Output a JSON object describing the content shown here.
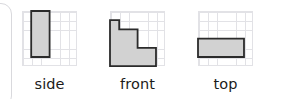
{
  "canvas": {
    "width": 285,
    "height": 99,
    "background": "#ffffff"
  },
  "style": {
    "grid_line_color": "#e2e2e6",
    "shape_fill": "#d2d2d2",
    "shape_stroke": "#2b2b2b",
    "label_color": "#1b1b1b",
    "panel_border_color": "#d9d9dd"
  },
  "figures": [
    {
      "name": "side",
      "label": "side",
      "grid": {
        "cols": 6,
        "rows": 6,
        "cell": 9.2
      },
      "shape": {
        "kind": "rectangle",
        "origin_col": 1,
        "origin_row": 0,
        "width_cells": 2,
        "height_cells": 5,
        "outline_cells": [
          [
            1,
            0
          ],
          [
            3,
            0
          ],
          [
            3,
            5
          ],
          [
            1,
            5
          ]
        ]
      }
    },
    {
      "name": "front",
      "label": "front",
      "grid": {
        "cols": 6,
        "rows": 6,
        "cell": 9.2
      },
      "shape": {
        "kind": "staircase",
        "column_heights": [
          5,
          4,
          4,
          2,
          2
        ],
        "origin_col": 0,
        "baseline_row": 6,
        "outline_cells": [
          [
            0,
            1
          ],
          [
            1,
            1
          ],
          [
            1,
            2
          ],
          [
            3,
            2
          ],
          [
            3,
            4
          ],
          [
            5,
            4
          ],
          [
            5,
            6
          ],
          [
            0,
            6
          ]
        ]
      }
    },
    {
      "name": "top",
      "label": "top",
      "grid": {
        "cols": 6,
        "rows": 6,
        "cell": 9.2
      },
      "shape": {
        "kind": "rectangle",
        "origin_col": 0,
        "origin_row": 3,
        "width_cells": 5,
        "height_cells": 2,
        "outline_cells": [
          [
            0,
            3
          ],
          [
            5,
            3
          ],
          [
            5,
            5
          ],
          [
            0,
            5
          ]
        ]
      }
    }
  ],
  "figure_positions": [
    {
      "left": 22
    },
    {
      "left": 110
    },
    {
      "left": 198
    }
  ]
}
